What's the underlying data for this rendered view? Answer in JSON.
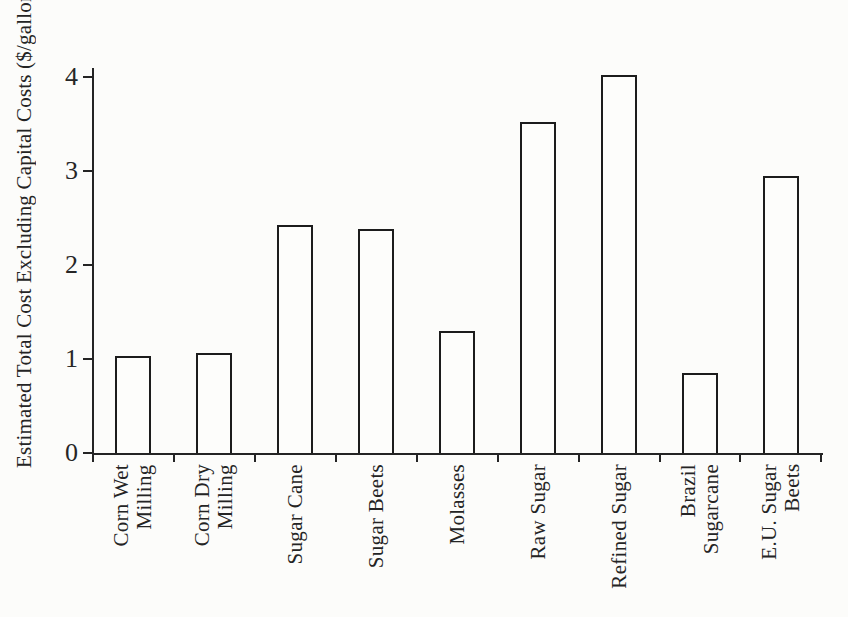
{
  "figure": {
    "background": "#fcfcfa",
    "ink": "#242424"
  },
  "chart_data": {
    "type": "bar",
    "title": "",
    "xlabel": "",
    "ylabel": "Estimated Total Cost Excluding Capital Costs ($/gallon)",
    "categories": [
      "Corn Wet\nMilling",
      "Corn Dry\nMilling",
      "Sugar Cane",
      "Sugar Beets",
      "Molasses",
      "Raw Sugar",
      "Refined Sugar",
      "Brazil\nSugarcane",
      "E.U. Sugar\nBeets"
    ],
    "values": [
      1.03,
      1.06,
      2.43,
      2.38,
      1.3,
      3.52,
      4.02,
      0.85,
      2.95
    ],
    "ylim": [
      0,
      4
    ],
    "yticks": [
      0,
      1,
      2,
      3,
      4
    ],
    "grid": false,
    "legend_position": "none",
    "bar_fill": "#fdfdfb",
    "bar_border": "#1c1c1c"
  }
}
